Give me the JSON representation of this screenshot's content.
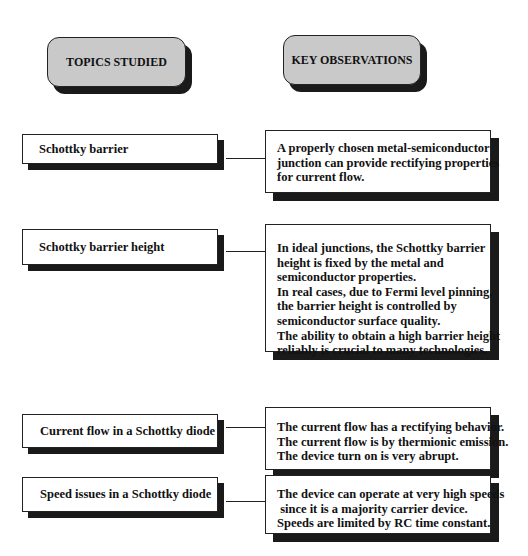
{
  "headers": {
    "left": "TOPICS STUDIED",
    "right": "KEY OBSERVATIONS"
  },
  "rows": [
    {
      "topic": "Schottky barrier",
      "observations": [
        "A properly chosen metal-semiconductor",
        "junction can provide rectifying properties",
        "for current flow."
      ]
    },
    {
      "topic": "Schottky barrier height",
      "observations": [
        "In ideal junctions, the Schottky barrier",
        "height is fixed by the metal and",
        "semiconductor properties.",
        "In real cases, due to Fermi level pinning,",
        "the barrier height is controlled by",
        "semiconductor surface quality.",
        "The ability to obtain a high barrier height",
        "reliably is crucial to many technologies."
      ]
    },
    {
      "topic": "Current flow in a Schottky diode",
      "observations": [
        "The current flow has a rectifying behavior.",
        "The current flow is by thermionic emission.",
        "The device turn on is very abrupt."
      ]
    },
    {
      "topic": "Speed issues in a Schottky diode",
      "observations": [
        "The device can operate at very high speeds",
        " since it is a majority carrier device.",
        "Speeds are limited by RC time constant."
      ]
    }
  ],
  "colors": {
    "header_fill": "#c9c9c9",
    "shadow": "#1a1a1a",
    "border": "#222222"
  }
}
